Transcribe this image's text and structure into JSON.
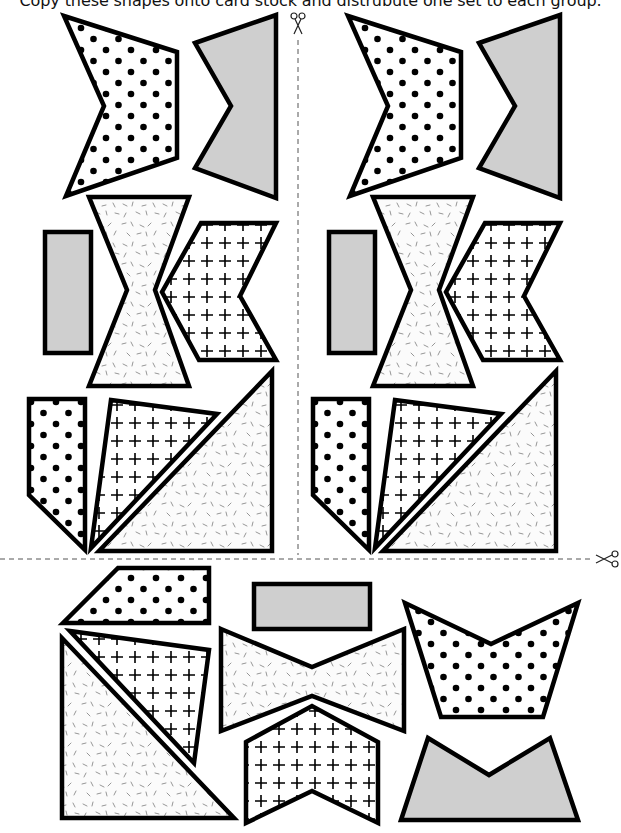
{
  "instruction": "Copy these shapes onto card stock and distrubute one set to each group.",
  "colors": {
    "outline": "#000000",
    "gray_fill": "#cfcfcf",
    "dot": "#000000",
    "speckle": "#8a8a8a",
    "cut_line": "#555555"
  },
  "fills": [
    "dots",
    "gray",
    "speckles",
    "crosses"
  ],
  "cut_marks": [
    {
      "name": "vertical-cut-line",
      "icon": "scissors-icon",
      "position": "top-center"
    },
    {
      "name": "horizontal-cut-line",
      "icon": "scissors-icon",
      "position": "right-middle"
    }
  ],
  "sets": [
    {
      "name": "set-top-left",
      "shapes": [
        {
          "name": "dotted-arrow",
          "fill": "dots"
        },
        {
          "name": "gray-arrow",
          "fill": "gray"
        },
        {
          "name": "gray-rectangle",
          "fill": "gray"
        },
        {
          "name": "speckled-bowtie",
          "fill": "speckles"
        },
        {
          "name": "cross-chevron",
          "fill": "crosses"
        },
        {
          "name": "dotted-pentagon",
          "fill": "dots"
        },
        {
          "name": "cross-triangle",
          "fill": "crosses"
        },
        {
          "name": "speckled-right-triangle",
          "fill": "speckles"
        }
      ]
    },
    {
      "name": "set-top-right",
      "shapes": [
        {
          "name": "dotted-arrow",
          "fill": "dots"
        },
        {
          "name": "gray-arrow",
          "fill": "gray"
        },
        {
          "name": "gray-rectangle",
          "fill": "gray"
        },
        {
          "name": "speckled-bowtie",
          "fill": "speckles"
        },
        {
          "name": "cross-chevron",
          "fill": "crosses"
        },
        {
          "name": "dotted-pentagon",
          "fill": "dots"
        },
        {
          "name": "cross-triangle",
          "fill": "crosses"
        },
        {
          "name": "speckled-right-triangle",
          "fill": "speckles"
        }
      ]
    },
    {
      "name": "set-bottom",
      "shapes": [
        {
          "name": "dotted-trapezoid",
          "fill": "dots"
        },
        {
          "name": "cross-triangle",
          "fill": "crosses"
        },
        {
          "name": "speckled-right-triangle",
          "fill": "speckles"
        },
        {
          "name": "gray-rectangle",
          "fill": "gray"
        },
        {
          "name": "speckled-bowtie",
          "fill": "speckles"
        },
        {
          "name": "cross-chevron",
          "fill": "crosses"
        },
        {
          "name": "dotted-notched-trapezoid",
          "fill": "dots"
        },
        {
          "name": "gray-notched-trapezoid",
          "fill": "gray"
        }
      ]
    }
  ]
}
